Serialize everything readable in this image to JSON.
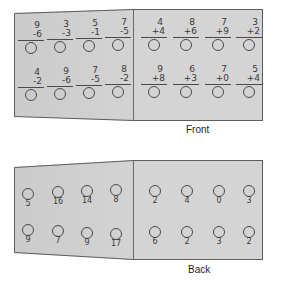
{
  "worksheet": {
    "front": {
      "caption": "Front",
      "left_panel": {
        "operation": "subtraction",
        "rows": [
          [
            {
              "top": "9",
              "bottom": "-6",
              "answer_box": "circle"
            },
            {
              "top": "3",
              "bottom": "-3",
              "answer_box": "circle"
            },
            {
              "top": "5",
              "bottom": "-1",
              "answer_box": "circle"
            },
            {
              "top": "7",
              "bottom": "-5",
              "answer_box": "circle"
            }
          ],
          [
            {
              "top": "4",
              "bottom": "-2",
              "answer_box": "circle"
            },
            {
              "top": "9",
              "bottom": "-6",
              "answer_box": "circle"
            },
            {
              "top": "7",
              "bottom": "-5",
              "answer_box": "circle"
            },
            {
              "top": "8",
              "bottom": "-2",
              "answer_box": "circle"
            }
          ]
        ]
      },
      "right_panel": {
        "operation": "addition",
        "rows": [
          [
            {
              "top": "4",
              "bottom": "+4",
              "answer_box": "circle"
            },
            {
              "top": "8",
              "bottom": "+6",
              "answer_box": "circle"
            },
            {
              "top": "7",
              "bottom": "+9",
              "answer_box": "circle"
            },
            {
              "top": "3",
              "bottom": "+2",
              "answer_box": "circle"
            }
          ],
          [
            {
              "top": "9",
              "bottom": "+8",
              "answer_box": "circle"
            },
            {
              "top": "6",
              "bottom": "+3",
              "answer_box": "circle"
            },
            {
              "top": "7",
              "bottom": "+0",
              "answer_box": "circle"
            },
            {
              "top": "5",
              "bottom": "+4",
              "answer_box": "circle"
            }
          ]
        ]
      }
    },
    "back": {
      "caption": "Back",
      "left_panel": {
        "rows": [
          [
            "5",
            "16",
            "14",
            "8"
          ],
          [
            "9",
            "7",
            "9",
            "17"
          ]
        ]
      },
      "right_panel": {
        "rows": [
          [
            "2",
            "4",
            "0",
            "3"
          ],
          [
            "6",
            "2",
            "3",
            "2"
          ]
        ]
      }
    }
  },
  "colors": {
    "paper": "#d2d2d2",
    "paper_left": "#cbcbcb",
    "ink": "#3a3a3a",
    "edge": "#5d5d5d",
    "caption": "#1d1d1d",
    "background": "#ffffff"
  }
}
